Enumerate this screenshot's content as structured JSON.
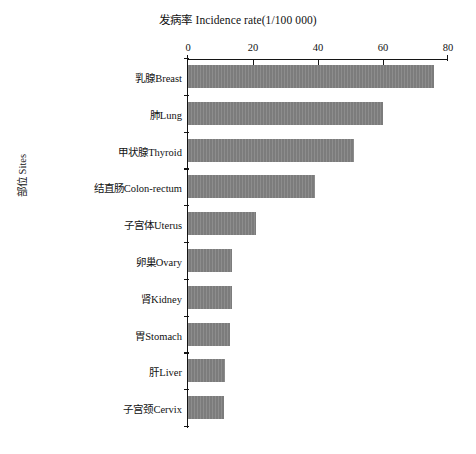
{
  "chart_data": {
    "type": "bar",
    "orientation": "horizontal",
    "title": "发病率  Incidence rate(1/100 000)",
    "xlabel": "发病率  Incidence rate(1/100 000)",
    "ylabel": "部位 Sites",
    "xlim": [
      0,
      80
    ],
    "xticks": [
      0,
      20,
      40,
      60,
      80
    ],
    "xtick_labels": [
      "0",
      "20",
      "40",
      "60",
      "80"
    ],
    "xaxis_position": "top",
    "grid": false,
    "legend": false,
    "bar_color": "#808080",
    "axis_color": "#141414",
    "categories": [
      "乳腺Breast",
      "肺Lung",
      "甲状腺Thyroid",
      "结直肠Colon-rectum",
      "子宫体Uterus",
      "卵巢Ovary",
      "肾Kidney",
      "胃Stomach",
      "肝Liver",
      "子宫颈Cervix"
    ],
    "values": [
      75.7,
      60.0,
      51.0,
      39.0,
      21.0,
      13.5,
      13.5,
      13.0,
      11.5,
      11.0
    ]
  }
}
